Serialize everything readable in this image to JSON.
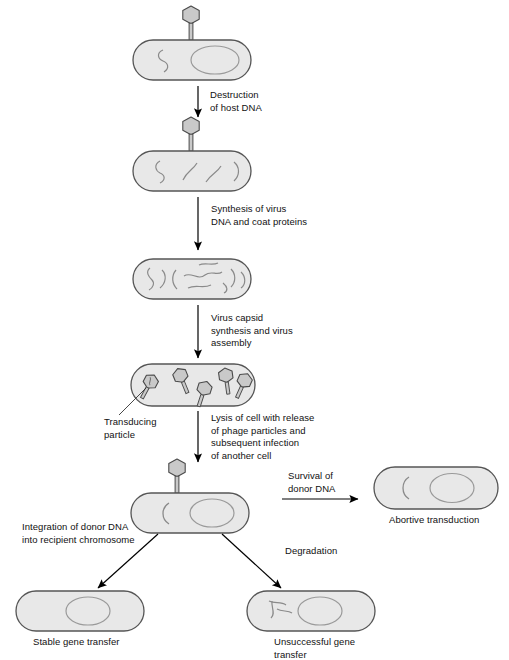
{
  "figure": {
    "type": "biological-process-diagram"
  },
  "colors": {
    "cell_fill": "#e8e8e8",
    "cell_stroke": "#555555",
    "chromosome_stroke": "#9a9a9a",
    "dna_stroke": "#8a8a8a",
    "phage_fill": "#c9c9c9",
    "phage_stroke": "#4a4a4a",
    "arrow": "#000000",
    "text": "#111111",
    "background": "#ffffff"
  },
  "steps": {
    "destruction": "Destruction\nof host DNA",
    "synthesis": "Synthesis of virus\nDNA and coat proteins",
    "capsid": "Virus capsid\nsynthesis and virus\nassembly",
    "lysis": "Lysis of cell with release\nof phage particles and\nsubsequent infection\nof another cell",
    "survival": "Survival of\ndonor DNA",
    "integration": "Integration of donor DNA\ninto recipient chromosome",
    "degradation": "Degradation"
  },
  "callouts": {
    "transducing_particle": "Transducing\nparticle"
  },
  "outcomes": {
    "abortive": "Abortive transduction",
    "stable": "Stable gene transfer",
    "unsuccessful": "Unsuccessful gene\ntransfer"
  },
  "cells": [
    {
      "id": "cell-1-infected-host",
      "phage_attached": true,
      "contents": "host chromosome plus donor DNA strand"
    },
    {
      "id": "cell-2-degraded-host-dna",
      "phage_attached": true,
      "contents": "fragmented host DNA"
    },
    {
      "id": "cell-3-replicated-dna",
      "phage_attached": false,
      "contents": "many DNA fragments"
    },
    {
      "id": "cell-4-assembled-phages",
      "phage_attached": false,
      "contents": "five phage particles, one transducing"
    },
    {
      "id": "cell-5-recipient",
      "phage_attached": true,
      "contents": "donor DNA fragment and recipient chromosome"
    },
    {
      "id": "cell-6-abortive",
      "phage_attached": false,
      "contents": "free donor DNA and chromosome"
    },
    {
      "id": "cell-7-stable",
      "phage_attached": false,
      "contents": "chromosome with integrated donor DNA"
    },
    {
      "id": "cell-8-unsuccessful",
      "phage_attached": false,
      "contents": "degraded DNA fragments and chromosome"
    }
  ],
  "phage_count_in_assembled_cell": 5,
  "icons": {
    "phage": "bacteriophage-icon",
    "cell": "bacterial-cell-icon",
    "arrow": "arrow-icon"
  }
}
